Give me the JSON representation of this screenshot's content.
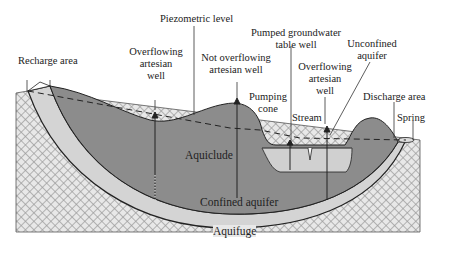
{
  "diagram": {
    "labels": {
      "piezometric_level": "Piezometric level",
      "recharge_area": "Recharge area",
      "overflowing_well_left": [
        "Overflowing",
        "artesian",
        "well"
      ],
      "not_overflowing_well": [
        "Not overflowing",
        "artesian well"
      ],
      "pumped_well": [
        "Pumped groundwater",
        "table well"
      ],
      "unconfined_aquifer": [
        "Unconfined",
        "aquifer"
      ],
      "pumping_cone": [
        "Pumping",
        "cone"
      ],
      "stream": "Stream",
      "overflowing_well_right": [
        "Overflowing",
        "artesian",
        "well"
      ],
      "discharge_area": "Discharge area",
      "spring": "Spring",
      "aquiclude": "Aquiclude",
      "confined_aquifer": "Confined aquifer",
      "aquifuge": "Aquifuge"
    },
    "colors": {
      "aquiclude": "#8c8c8c",
      "confined_aquifer": "#d4d4d4",
      "unconfined_aquifer": "#c8c8c8",
      "aquifuge_bg": "#e6e6e6",
      "aquifuge_hatch": "#9a9a9a",
      "outline": "#222222"
    }
  }
}
